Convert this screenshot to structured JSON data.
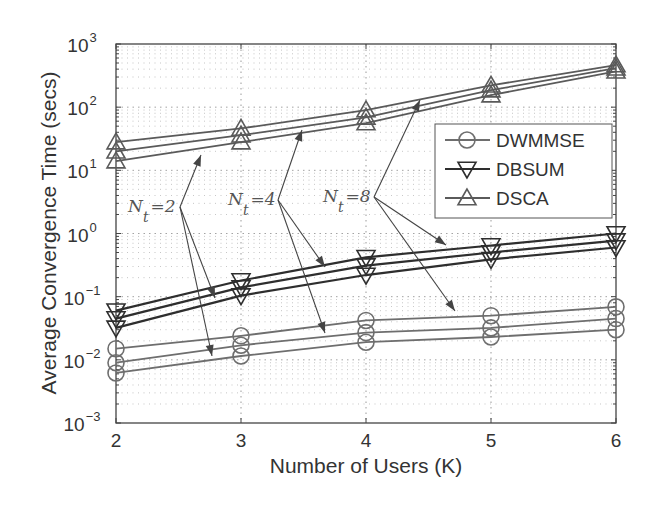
{
  "chart_data": {
    "type": "line",
    "title": "",
    "xlabel": "Number of Users (K)",
    "ylabel": "Average Convergence Time (secs)",
    "x": [
      2,
      3,
      4,
      5,
      6
    ],
    "xlim": [
      2,
      6
    ],
    "ylim": [
      0.001,
      1000
    ],
    "yscale": "log",
    "x_ticks": [
      "2",
      "3",
      "4",
      "5",
      "6"
    ],
    "y_ticks": [
      {
        "base": "10",
        "exp": "3"
      },
      {
        "base": "10",
        "exp": "2"
      },
      {
        "base": "10",
        "exp": "1"
      },
      {
        "base": "10",
        "exp": "0"
      },
      {
        "base": "10",
        "exp": "−1"
      },
      {
        "base": "10",
        "exp": "−2"
      },
      {
        "base": "10",
        "exp": "−3"
      }
    ],
    "grid": true,
    "legend_position": "upper right (inside)",
    "series": [
      {
        "name": "DWMMSE",
        "marker": "circle",
        "Nt": 8,
        "values": [
          0.015,
          0.024,
          0.042,
          0.05,
          0.069
        ]
      },
      {
        "name": "DWMMSE",
        "marker": "circle",
        "Nt": 4,
        "values": [
          0.009,
          0.017,
          0.027,
          0.032,
          0.045
        ]
      },
      {
        "name": "DWMMSE",
        "marker": "circle",
        "Nt": 2,
        "values": [
          0.0062,
          0.0115,
          0.019,
          0.023,
          0.03
        ]
      },
      {
        "name": "DBSUM",
        "marker": "triangle-down",
        "Nt": 8,
        "values": [
          0.06,
          0.18,
          0.42,
          0.645,
          1.0
        ]
      },
      {
        "name": "DBSUM",
        "marker": "triangle-down",
        "Nt": 4,
        "values": [
          0.045,
          0.14,
          0.31,
          0.5,
          0.77
        ]
      },
      {
        "name": "DBSUM",
        "marker": "triangle-down",
        "Nt": 2,
        "values": [
          0.032,
          0.104,
          0.22,
          0.39,
          0.6
        ]
      },
      {
        "name": "DSCA",
        "marker": "triangle-up",
        "Nt": 8,
        "values": [
          28,
          46,
          90,
          222,
          464
        ]
      },
      {
        "name": "DSCA",
        "marker": "triangle-up",
        "Nt": 4,
        "values": [
          20,
          36,
          69,
          186,
          414
        ]
      },
      {
        "name": "DSCA",
        "marker": "triangle-up",
        "Nt": 2,
        "values": [
          14,
          28,
          56,
          155,
          370
        ]
      }
    ],
    "legend": [
      {
        "label": "DWMMSE",
        "marker": "circle"
      },
      {
        "label": "DBSUM",
        "marker": "triangle-down"
      },
      {
        "label": "DSCA",
        "marker": "triangle-up"
      }
    ],
    "annotations": [
      {
        "symbol": "N",
        "sub": "t",
        "text": "=2"
      },
      {
        "symbol": "N",
        "sub": "t",
        "text": "=4"
      },
      {
        "symbol": "N",
        "sub": "t",
        "text": "=8"
      }
    ]
  },
  "colors": {
    "DWMMSE": "#6e6e6e",
    "DBSUM": "#2e2e2e",
    "DSCA": "#5a5a5a",
    "axis": "#444444",
    "grid": "#9a9a9a",
    "arrow": "#444444"
  }
}
